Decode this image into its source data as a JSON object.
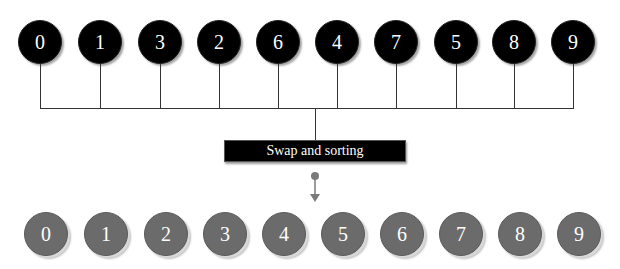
{
  "diagram": {
    "input_sequence": [
      "0",
      "1",
      "3",
      "2",
      "6",
      "4",
      "7",
      "5",
      "8",
      "9"
    ],
    "process_label": "Swap and sorting",
    "output_sequence": [
      "0",
      "1",
      "2",
      "3",
      "4",
      "5",
      "6",
      "7",
      "8",
      "9"
    ],
    "colors": {
      "input_node": "#000000",
      "output_node": "#6b6b6b",
      "connector": "#333333",
      "arrow": "#7a7a7a"
    }
  }
}
